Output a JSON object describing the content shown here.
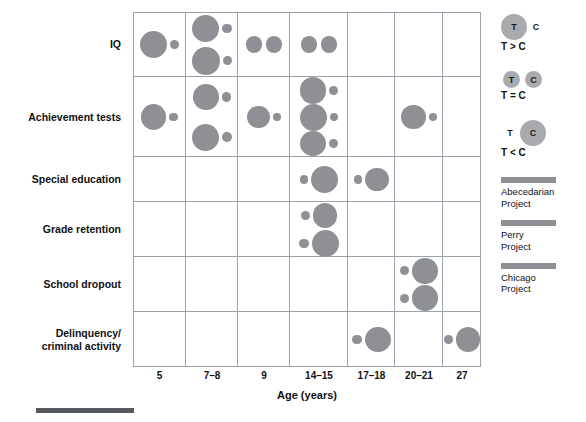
{
  "chart_data": {
    "type": "scatter",
    "title": "",
    "xlabel": "Age (years)",
    "ylabel": "",
    "categories": [
      "5",
      "7–8",
      "9",
      "14–15",
      "17–18",
      "20–21",
      "27"
    ],
    "rows": [
      "IQ",
      "Achievement tests",
      "Special education",
      "Grade retention",
      "School dropout",
      "Delinquency/\ncriminal activity"
    ],
    "grid": true,
    "legend_position": "right",
    "encoding": "Each pair of circles = treatment (T) vs control (C) group; circle area encodes relative outcome magnitude.",
    "points": [
      {
        "row": "IQ",
        "age": "5",
        "relation": "T > C",
        "t": 1.0,
        "c": 0.33
      },
      {
        "row": "IQ",
        "age": "7–8",
        "relation": "T > C",
        "t": 1.0,
        "c": 0.35
      },
      {
        "row": "IQ",
        "age": "7–8",
        "relation": "T > C",
        "t": 1.05,
        "c": 0.33
      },
      {
        "row": "IQ",
        "age": "9",
        "relation": "T = C",
        "t": 0.62,
        "c": 0.62
      },
      {
        "row": "IQ",
        "age": "14–15",
        "relation": "T = C",
        "t": 0.62,
        "c": 0.62
      },
      {
        "row": "Achievement tests",
        "age": "5",
        "relation": "T > C",
        "t": 0.93,
        "c": 0.32
      },
      {
        "row": "Achievement tests",
        "age": "7–8",
        "relation": "T > C",
        "t": 0.95,
        "c": 0.35
      },
      {
        "row": "Achievement tests",
        "age": "7–8",
        "relation": "T > C",
        "t": 1.0,
        "c": 0.35
      },
      {
        "row": "Achievement tests",
        "age": "9",
        "relation": "T > C",
        "t": 0.85,
        "c": 0.33
      },
      {
        "row": "Achievement tests",
        "age": "14–15",
        "relation": "T > C",
        "t": 0.98,
        "c": 0.33
      },
      {
        "row": "Achievement tests",
        "age": "14–15",
        "relation": "T > C",
        "t": 1.0,
        "c": 0.33
      },
      {
        "row": "Achievement tests",
        "age": "14–15",
        "relation": "T > C",
        "t": 0.95,
        "c": 0.33
      },
      {
        "row": "Achievement tests",
        "age": "20–21",
        "relation": "T > C",
        "t": 0.9,
        "c": 0.3
      },
      {
        "row": "Special education",
        "age": "14–15",
        "relation": "T < C",
        "t": 0.33,
        "c": 1.0
      },
      {
        "row": "Special education",
        "age": "17–18",
        "relation": "T < C",
        "t": 0.3,
        "c": 0.88
      },
      {
        "row": "Grade retention",
        "age": "14–15",
        "relation": "T < C",
        "t": 0.33,
        "c": 0.92
      },
      {
        "row": "Grade retention",
        "age": "14–15",
        "relation": "T < C",
        "t": 0.35,
        "c": 1.0
      },
      {
        "row": "School dropout",
        "age": "20–21",
        "relation": "T < C",
        "t": 0.33,
        "c": 0.95
      },
      {
        "row": "School dropout",
        "age": "20–21",
        "relation": "T < C",
        "t": 0.35,
        "c": 0.95
      },
      {
        "row": "Delinquency/criminal activity",
        "age": "17–18",
        "relation": "T < C",
        "t": 0.35,
        "c": 0.95
      },
      {
        "row": "Delinquency/criminal activity",
        "age": "27",
        "relation": "T < C",
        "t": 0.32,
        "c": 0.9
      }
    ]
  },
  "row_labels": [
    {
      "id": "iq",
      "text": "IQ"
    },
    {
      "id": "achievement-tests",
      "text": "Achievement tests"
    },
    {
      "id": "special-education",
      "text": "Special education"
    },
    {
      "id": "grade-retention",
      "text": "Grade retention"
    },
    {
      "id": "school-dropout",
      "text": "School dropout"
    },
    {
      "id": "delinquency-criminal-activity",
      "line1": "Delinquency/",
      "line2": "criminal activity"
    }
  ],
  "xaxis": {
    "title": "Age (years)",
    "ticks": [
      "5",
      "7–8",
      "9",
      "14–15",
      "17–18",
      "20–21",
      "27"
    ]
  },
  "legend": {
    "relations": [
      {
        "id": "t-greater-c",
        "t_label": "T",
        "c_label": "C",
        "caption": "T > C"
      },
      {
        "id": "t-equal-c",
        "t_label": "T",
        "c_label": "C",
        "caption": "T = C"
      },
      {
        "id": "t-less-c",
        "t_label": "T",
        "c_label": "C",
        "caption": "T < C"
      }
    ],
    "projects": [
      {
        "id": "abecedarian",
        "line1": "Abecedarian",
        "line2": "Project",
        "color": "#8e9095"
      },
      {
        "id": "perry",
        "line1": "Perry",
        "line2": "Project",
        "color": "#8e9095"
      },
      {
        "id": "chicago",
        "line1": "Chicago",
        "line2": "Project",
        "color": "#8e9095"
      }
    ]
  },
  "colors": {
    "bubble": "#8e9095",
    "legend_bubble": "#a8aaae",
    "grid_line": "#9aa3ad",
    "text": "#111111",
    "rule": "#55585c"
  }
}
